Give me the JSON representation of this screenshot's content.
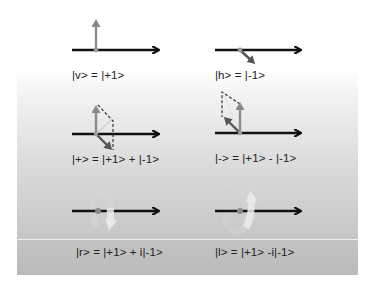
{
  "colors": {
    "axis": "#111111",
    "state_vector": "#8a8a8a",
    "component_vector": "#555555",
    "dashed": "#333333",
    "panel_light": "#f3f3f3",
    "panel_dark": "#bdbdbd",
    "separator": "#efefef"
  },
  "states": [
    {
      "id": "v",
      "label": "|v> = |+1>",
      "diagram": "vertical-vector"
    },
    {
      "id": "h",
      "label": "|h> = |-1>",
      "diagram": "down-right-vector"
    },
    {
      "id": "plus",
      "label": "|+> = |+1> + |-1>",
      "diagram": "superposition-sum"
    },
    {
      "id": "minus",
      "label": "|-> = |+1> - |-1>",
      "diagram": "superposition-difference"
    },
    {
      "id": "r",
      "label": "|r> = |+1> + i|-1>",
      "diagram": "rotation-clockwise"
    },
    {
      "id": "l",
      "label": "|l> = |+1> -i|-1>",
      "diagram": "rotation-counterclockwise"
    }
  ]
}
